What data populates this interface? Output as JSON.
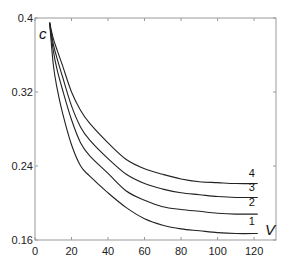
{
  "chart_data": {
    "type": "line",
    "title": "",
    "xlabel": "V",
    "ylabel": "c",
    "xlim": [
      0,
      132
    ],
    "ylim": [
      0.16,
      0.4
    ],
    "grid": false,
    "legend": "inline labels at right end of each curve",
    "xticks": [
      0,
      20,
      40,
      60,
      80,
      100,
      120
    ],
    "xtick_labels": [
      "0",
      "20",
      "40",
      "60",
      "80",
      "100",
      "120"
    ],
    "yticks": [
      0.16,
      0.24,
      0.32,
      0.4
    ],
    "ytick_labels": [
      "0.16",
      "0.24",
      "0.32",
      "0.4"
    ],
    "x": [
      8,
      10,
      12,
      15,
      20,
      25,
      30,
      40,
      50,
      60,
      70,
      80,
      90,
      100,
      110,
      122
    ],
    "series": [
      {
        "name": "1",
        "values": [
          0.395,
          0.35,
          0.325,
          0.298,
          0.263,
          0.24,
          0.229,
          0.211,
          0.195,
          0.183,
          0.176,
          0.172,
          0.17,
          0.168,
          0.167,
          0.167
        ]
      },
      {
        "name": "2",
        "values": [
          0.395,
          0.365,
          0.345,
          0.323,
          0.29,
          0.265,
          0.251,
          0.232,
          0.213,
          0.203,
          0.196,
          0.193,
          0.191,
          0.189,
          0.188,
          0.188
        ]
      },
      {
        "name": "3",
        "values": [
          0.395,
          0.372,
          0.357,
          0.337,
          0.305,
          0.282,
          0.268,
          0.248,
          0.231,
          0.221,
          0.215,
          0.211,
          0.209,
          0.207,
          0.206,
          0.206
        ]
      },
      {
        "name": "4",
        "values": [
          0.395,
          0.378,
          0.366,
          0.349,
          0.32,
          0.3,
          0.286,
          0.265,
          0.247,
          0.237,
          0.231,
          0.226,
          0.223,
          0.222,
          0.221,
          0.221
        ]
      }
    ],
    "colors": {
      "line": "#222222",
      "axis": "#9a9a9a",
      "text": "#222222"
    }
  }
}
